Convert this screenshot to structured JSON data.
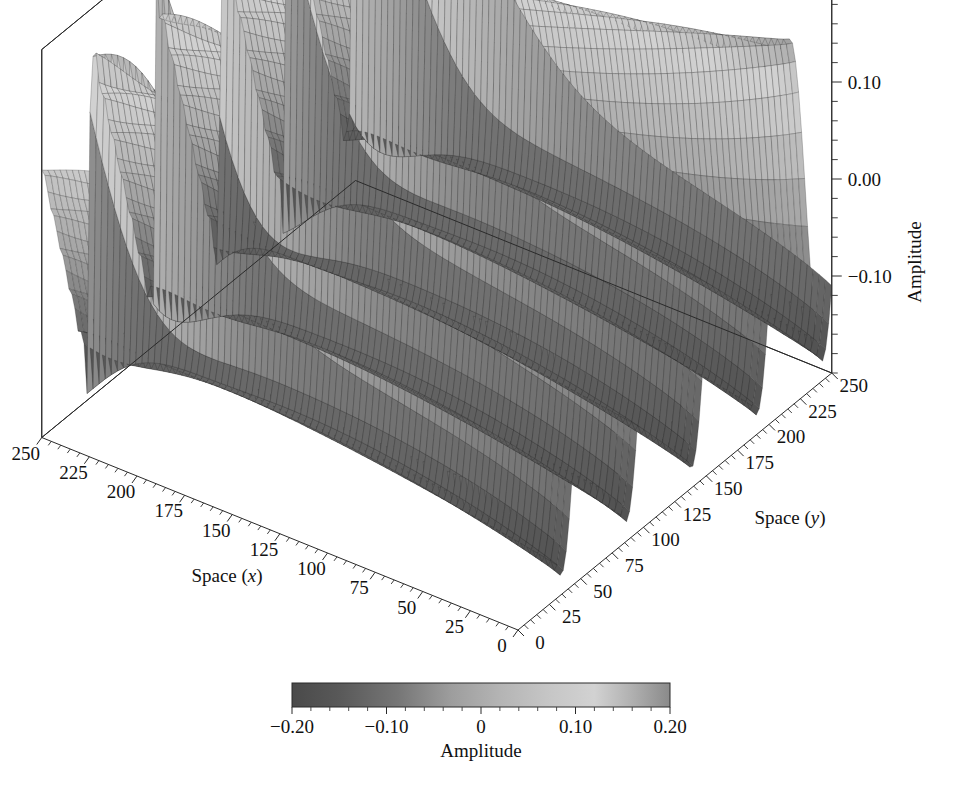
{
  "figure": {
    "type": "3d-surface-plot",
    "background_color": "#ffffff",
    "line_color": "#2a2a2a"
  },
  "axes": {
    "x": {
      "title_prefix": "Space (",
      "title_var": "x",
      "title_suffix": ")",
      "title": "Space (x)",
      "ticks": [
        "0",
        "25",
        "50",
        "75",
        "100",
        "125",
        "150",
        "175",
        "200",
        "225",
        "250"
      ],
      "values": [
        0,
        25,
        50,
        75,
        100,
        125,
        150,
        175,
        200,
        225,
        250
      ],
      "range": [
        0,
        250
      ],
      "direction": "increases toward upper-left"
    },
    "y": {
      "title_prefix": "Space (",
      "title_var": "y",
      "title_suffix": ")",
      "title": "Space (y)",
      "ticks": [
        "0",
        "25",
        "50",
        "75",
        "100",
        "125",
        "150",
        "175",
        "200",
        "225",
        "250"
      ],
      "values": [
        0,
        25,
        50,
        75,
        100,
        125,
        150,
        175,
        200,
        225,
        250
      ],
      "range": [
        0,
        250
      ],
      "direction": "increases toward upper-right"
    },
    "z": {
      "title": "Amplitude",
      "ticks": [
        "-0.10",
        "0.00",
        "0.10",
        "0.20"
      ],
      "tick_display": [
        "−0.10",
        "0.00",
        "0.10",
        "0.20"
      ],
      "values": [
        -0.1,
        0.0,
        0.1,
        0.2
      ],
      "range": [
        -0.2,
        0.2
      ],
      "minor_ticks_per_interval": 4,
      "position": "right"
    }
  },
  "colorbar": {
    "label": "Amplitude",
    "ticks": [
      "-0.20",
      "-0.10",
      "0",
      "0.10",
      "0.20"
    ],
    "tick_display": [
      "−0.20",
      "−0.10",
      "0",
      "0.10",
      "0.20"
    ],
    "values": [
      -0.2,
      -0.1,
      0,
      0.1,
      0.2
    ],
    "range": [
      -0.2,
      0.2
    ],
    "orientation": "horizontal",
    "colormap": "grayscale-bone",
    "stops": [
      {
        "pos": 0.0,
        "color": "#4a4a4a"
      },
      {
        "pos": 0.12,
        "color": "#585858"
      },
      {
        "pos": 0.28,
        "color": "#767676"
      },
      {
        "pos": 0.42,
        "color": "#9d9d9d"
      },
      {
        "pos": 0.55,
        "color": "#b4b4b4"
      },
      {
        "pos": 0.68,
        "color": "#c6c6c6"
      },
      {
        "pos": 0.8,
        "color": "#d2d2d2"
      },
      {
        "pos": 0.9,
        "color": "#b0b0b0"
      },
      {
        "pos": 1.0,
        "color": "#8a8a8a"
      }
    ]
  },
  "chart_data": {
    "type": "surface",
    "title": "",
    "xlabel": "Space (x)",
    "ylabel": "Space (y)",
    "zlabel": "Amplitude",
    "colorbar_label": "Amplitude",
    "xlim": [
      0,
      250
    ],
    "ylim": [
      0,
      250
    ],
    "zlim": [
      -0.2,
      0.2
    ],
    "grid": false,
    "legend": "none",
    "mesh": {
      "nx": 96,
      "ny": 120,
      "wireframe": true
    },
    "surface_model": {
      "form": "sawtooth_steepening",
      "base_wavelength_y": 52,
      "n_ridges_visible": 5,
      "amplitude": 0.18,
      "steepening_axis": "x",
      "smooth_at_x": 0,
      "shock_at_x": 250
    },
    "z_extremes": {
      "min": -0.2,
      "max": 0.2
    },
    "sampled_ridge_peaks": [
      {
        "x": 250,
        "z": 0.18
      },
      {
        "x": 200,
        "z": 0.18
      },
      {
        "x": 150,
        "z": 0.17
      },
      {
        "x": 100,
        "z": 0.17
      },
      {
        "x": 50,
        "z": 0.17
      },
      {
        "x": 0,
        "z": 0.16
      }
    ],
    "sampled_trough_values": [
      {
        "x": 250,
        "z": -0.19
      },
      {
        "x": 125,
        "z": -0.18
      },
      {
        "x": 0,
        "z": -0.17
      }
    ]
  }
}
